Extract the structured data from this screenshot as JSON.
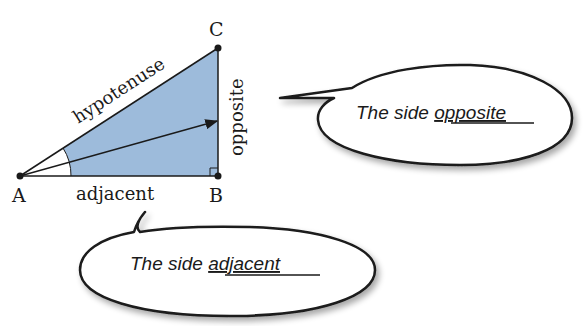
{
  "diagram": {
    "fill_color": "#9dbbdb",
    "line_color": "#1a1a1a",
    "vertices": {
      "A": {
        "label": "A"
      },
      "B": {
        "label": "B"
      },
      "C": {
        "label": "C"
      }
    },
    "sides": {
      "hypotenuse": "hypotenuse",
      "opposite": "opposite",
      "adjacent": "adjacent"
    },
    "callouts": {
      "opposite": {
        "prefix": "The side ",
        "keyword": "opposite"
      },
      "adjacent": {
        "prefix": "The side ",
        "keyword": "adjacent"
      }
    }
  }
}
